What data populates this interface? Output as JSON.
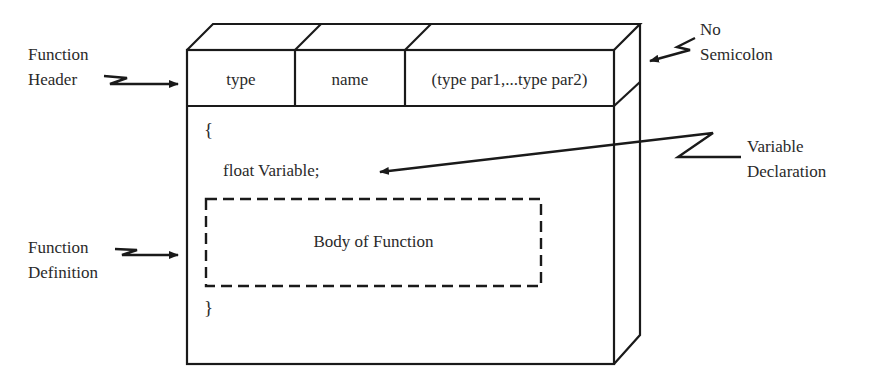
{
  "diagram": {
    "type": "annotated-3d-box",
    "header_cells": [
      {
        "label": "type"
      },
      {
        "label": "name"
      },
      {
        "label": "(type par1,...type par2)"
      }
    ],
    "body": {
      "open_brace": "{",
      "declaration": "float Variable;",
      "inner_box_label": "Body of Function",
      "close_brace": "}"
    },
    "annotations": {
      "function_header": {
        "line1": "Function",
        "line2": "Header"
      },
      "function_definition": {
        "line1": "Function",
        "line2": "Definition"
      },
      "no_semicolon": {
        "line1": "No",
        "line2": "Semicolon"
      },
      "variable_declaration": {
        "line1": "Variable",
        "line2": "Declaration"
      }
    },
    "colors": {
      "stroke": "#1a1a1a",
      "text": "#2a2a2a",
      "background": "#ffffff"
    }
  }
}
